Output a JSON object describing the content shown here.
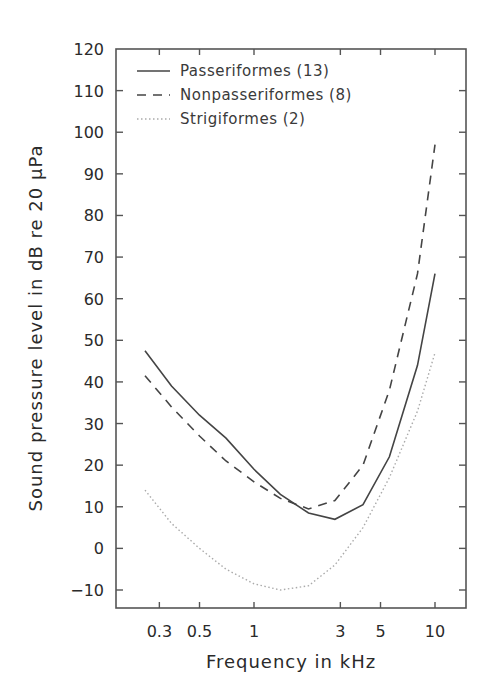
{
  "chart_data": {
    "type": "line",
    "title": "",
    "xlabel": "Frequency in kHz",
    "ylabel": "Sound pressure level in dB re 20 μPa",
    "xscale": "log",
    "xlim": [
      0.2,
      13
    ],
    "ylim": [
      -15,
      120
    ],
    "x_ticks": [
      0.3,
      0.5,
      1,
      3,
      5,
      10
    ],
    "x_tick_labels": [
      "0.3",
      "0.5",
      "1",
      "3",
      "5",
      "10"
    ],
    "y_ticks": [
      -10,
      0,
      10,
      20,
      30,
      40,
      50,
      60,
      70,
      80,
      90,
      100,
      110,
      120
    ],
    "y_tick_labels": [
      "−10",
      "0",
      "10",
      "20",
      "30",
      "40",
      "50",
      "60",
      "70",
      "80",
      "90",
      "100",
      "110",
      "120"
    ],
    "grid": false,
    "legend_position": "upper left",
    "x": [
      0.25,
      0.35,
      0.5,
      0.7,
      1.0,
      1.4,
      2.0,
      2.8,
      4.0,
      5.6,
      8.0,
      10.0
    ],
    "series": [
      {
        "name": "Passeriformes (13)",
        "style": "solid",
        "values": [
          47.5,
          39,
          32,
          26.5,
          19,
          13,
          8.5,
          7,
          10.5,
          22,
          44,
          66
        ]
      },
      {
        "name": "Nonpasseriformes (8)",
        "style": "dashed",
        "values": [
          41.5,
          34,
          27,
          21,
          16,
          12,
          9.5,
          11.5,
          20,
          38,
          66,
          97
        ]
      },
      {
        "name": "Strigiformes (2)",
        "style": "dotted",
        "values": [
          14,
          6,
          0,
          -5,
          -8.5,
          -10,
          -9,
          -4,
          5,
          17,
          33,
          47
        ]
      }
    ]
  },
  "axes": {
    "xlabel": "Frequency in kHz",
    "ylabel": "Sound pressure level in dB re 20 μPa"
  },
  "legend": [
    {
      "label": "Passeriformes (13)"
    },
    {
      "label": "Nonpasseriformes (8)"
    },
    {
      "label": "Strigiformes (2)"
    }
  ],
  "colors": {
    "line": "#444444",
    "dotted": "#b0b0b0",
    "frame": "#555555"
  }
}
